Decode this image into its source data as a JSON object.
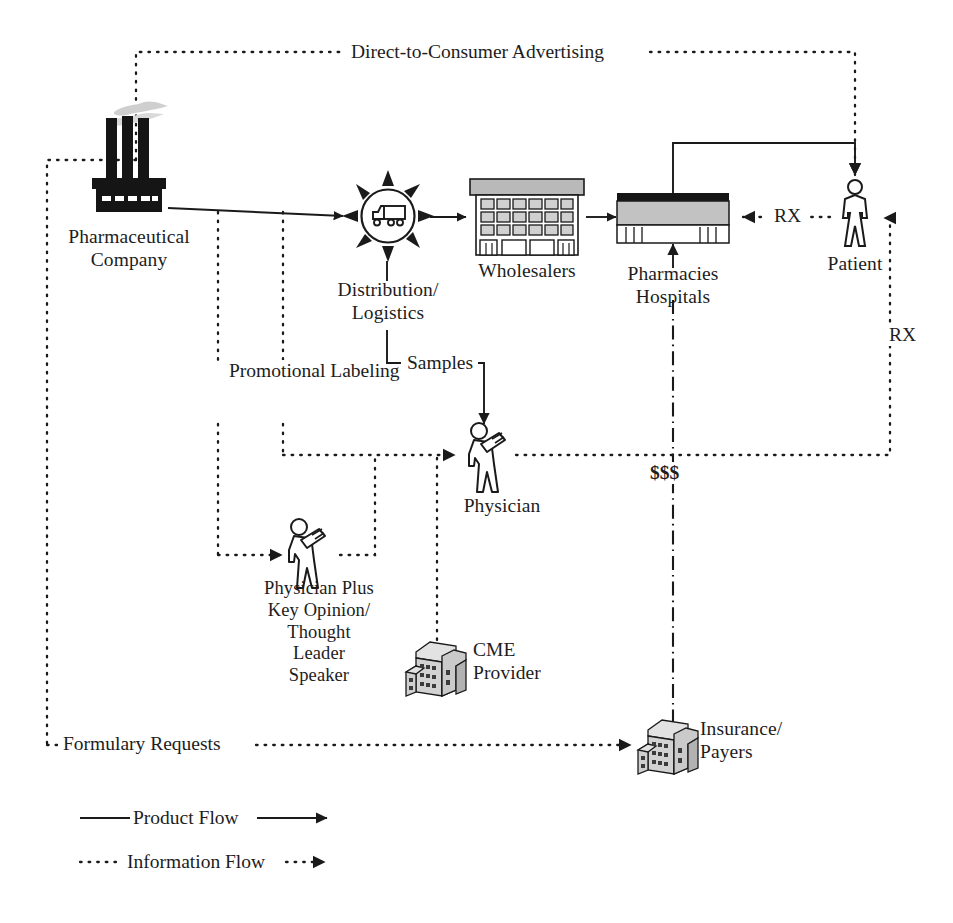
{
  "diagram": {
    "colors": {
      "ink": "#1a1a1a",
      "stroke": "#222222",
      "factory_fill": "#151515",
      "smoke": "#cfcfcf",
      "building_gray": "#b9b9b9",
      "building_light": "#d9d9d9",
      "paper": "#ffffff"
    },
    "nodes": [
      {
        "id": "pharma-company",
        "label": "Pharmaceutical\nCompany",
        "icon": "factory-icon"
      },
      {
        "id": "distribution",
        "label": "Distribution/\nLogistics",
        "icon": "truck-in-circle-icon"
      },
      {
        "id": "wholesalers",
        "label": "Wholesalers",
        "icon": "warehouse-building-icon"
      },
      {
        "id": "pharmacies",
        "label": "Pharmacies\nHospitals",
        "icon": "pharmacy-building-icon"
      },
      {
        "id": "patient",
        "label": "Patient",
        "icon": "person-icon"
      },
      {
        "id": "physician",
        "label": "Physician",
        "icon": "physician-icon"
      },
      {
        "id": "kol-speaker",
        "label": "Physician Plus\nKey Opinion/\nThought\nLeader\nSpeaker",
        "icon": "physician-icon"
      },
      {
        "id": "cme-provider",
        "label": "CME\nProvider",
        "icon": "office-building-icon"
      },
      {
        "id": "insurance-payers",
        "label": "Insurance/\nPayers",
        "icon": "office-building-icon"
      }
    ],
    "edge_labels": [
      {
        "id": "dtc-advertising",
        "text": "Direct-to-Consumer Advertising",
        "flow": "information"
      },
      {
        "id": "promotional-labeling",
        "text": "Promotional\nLabeling",
        "flow": "information"
      },
      {
        "id": "samples",
        "text": "Samples",
        "flow": "product"
      },
      {
        "id": "rx-pharmacy",
        "text": "RX",
        "flow": "information"
      },
      {
        "id": "rx-physician",
        "text": "RX",
        "flow": "information"
      },
      {
        "id": "money",
        "text": "$$$",
        "flow": "money"
      },
      {
        "id": "formulary-requests",
        "text": "Formulary Requests",
        "flow": "information"
      }
    ],
    "legend": {
      "items": [
        {
          "id": "product-flow",
          "label": "Product Flow",
          "style": "solid"
        },
        {
          "id": "information-flow",
          "label": "Information Flow",
          "style": "dotted"
        }
      ]
    }
  }
}
